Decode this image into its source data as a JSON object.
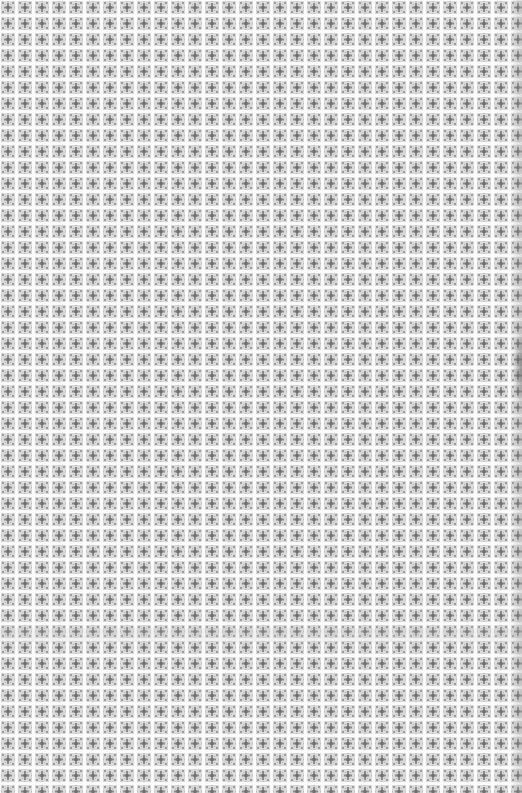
{
  "pattern": {
    "name": "repeating tile texture",
    "tile_width": 17,
    "tile_height": 16,
    "colors": {
      "background": "#f4f4f4",
      "gutter": "#fbfbfb",
      "tile_fill": "#d8d8d8",
      "motif": "#9a9a9a",
      "motif_dark": "#7d7d7d"
    }
  },
  "artifacts": {
    "right_edge_smudge": {
      "top": 330,
      "height": 75
    },
    "faint_band": {
      "top": 628,
      "height": 14
    }
  }
}
